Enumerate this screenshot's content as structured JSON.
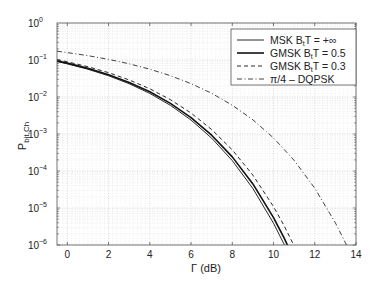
{
  "chart_data": {
    "type": "line",
    "title": "",
    "xlabel": "Γ (dB)",
    "ylabel_main": "P",
    "ylabel_sub": "bit,Ch",
    "xlim": [
      -0.5,
      14
    ],
    "ylim": [
      1e-06,
      1
    ],
    "yscale": "log",
    "grid": true,
    "legend_position": "top-right",
    "xticks": [
      0,
      2,
      4,
      6,
      8,
      10,
      12,
      14
    ],
    "yticks": [
      {
        "value": 1,
        "base": "10",
        "exp": "0"
      },
      {
        "value": 0.1,
        "base": "10",
        "exp": "−1"
      },
      {
        "value": 0.01,
        "base": "10",
        "exp": "−2"
      },
      {
        "value": 0.001,
        "base": "10",
        "exp": "−3"
      },
      {
        "value": 0.0001,
        "base": "10",
        "exp": "−4"
      },
      {
        "value": 1e-05,
        "base": "10",
        "exp": "−5"
      },
      {
        "value": 1e-06,
        "base": "10",
        "exp": "−6"
      }
    ],
    "series": [
      {
        "name": "MSK B_tT = +∞",
        "legend_main": "MSK B",
        "legend_sub": "t",
        "legend_rest": "T = +∞",
        "style": "solid-thin",
        "x": [
          -0.5,
          0,
          1,
          2,
          3,
          4,
          5,
          6,
          7,
          8,
          9,
          10,
          10.5,
          11
        ],
        "y": [
          0.0909,
          0.0786,
          0.0563,
          0.0375,
          0.0229,
          0.0125,
          0.00595,
          0.00239,
          0.000773,
          0.000191,
          3.36e-05,
          3.87e-06,
          1.08e-06,
          2.6e-07
        ]
      },
      {
        "name": "GMSK B_tT = 0.5",
        "legend_main": "GMSK B",
        "legend_sub": "t",
        "legend_rest": "T = 0.5",
        "style": "solid-thick",
        "x": [
          -0.5,
          0,
          1,
          2,
          3,
          4,
          5,
          6,
          7,
          8,
          9,
          10,
          10.5,
          11
        ],
        "y": [
          0.0948,
          0.0823,
          0.0594,
          0.0401,
          0.0248,
          0.0138,
          0.00672,
          0.00278,
          0.000929,
          0.000241,
          4.47e-05,
          5.52e-06,
          1.61e-06,
          4.07e-07
        ]
      },
      {
        "name": "GMSK B_tT = 0.3",
        "legend_main": "GMSK B",
        "legend_sub": "t",
        "legend_rest": "T = 0.3",
        "style": "dashed",
        "x": [
          -0.5,
          0,
          1,
          2,
          3,
          4,
          5,
          6,
          7,
          8,
          9,
          10,
          10.5,
          11,
          11.5
        ],
        "y": [
          0.1024,
          0.0896,
          0.0659,
          0.0455,
          0.0289,
          0.0167,
          0.00847,
          0.00369,
          0.00132,
          0.000372,
          7.71e-05,
          1.09e-05,
          3.43e-06,
          9.45e-07,
          2.24e-07
        ]
      },
      {
        "name": "π/4 – DQPSK",
        "legend_main": "π/4 – DQPSK",
        "legend_sub": "",
        "legend_rest": "",
        "style": "dashdot",
        "x": [
          -0.5,
          0,
          1,
          2,
          3,
          4,
          5,
          6,
          7,
          8,
          9,
          10,
          11,
          12,
          13,
          13.5,
          14
        ],
        "y": [
          0.1726,
          0.1587,
          0.131,
          0.104,
          0.0789,
          0.0565,
          0.0377,
          0.023,
          0.0126,
          0.006,
          0.00242,
          0.000783,
          0.000194,
          3.43e-05,
          3.97e-06,
          1.11e-06,
          2.7e-07
        ]
      }
    ]
  }
}
